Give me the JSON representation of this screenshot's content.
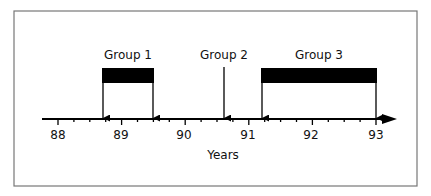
{
  "diagram": {
    "type": "timeline",
    "axis": {
      "label": "Years",
      "ticks": [
        "88",
        "89",
        "90",
        "91",
        "92",
        "93"
      ],
      "start": 88,
      "end": 93,
      "minor_divisions_per_year": 4
    },
    "groups": [
      {
        "label": "Group 1",
        "type": "interval",
        "start": 88.7,
        "end": 89.5
      },
      {
        "label": "Group 2",
        "type": "point",
        "at": 90.6
      },
      {
        "label": "Group 3",
        "type": "interval",
        "start": 91.2,
        "end": 93.0
      }
    ],
    "colors": {
      "frame": "#777777",
      "ink": "#000000",
      "background": "#ffffff"
    }
  }
}
